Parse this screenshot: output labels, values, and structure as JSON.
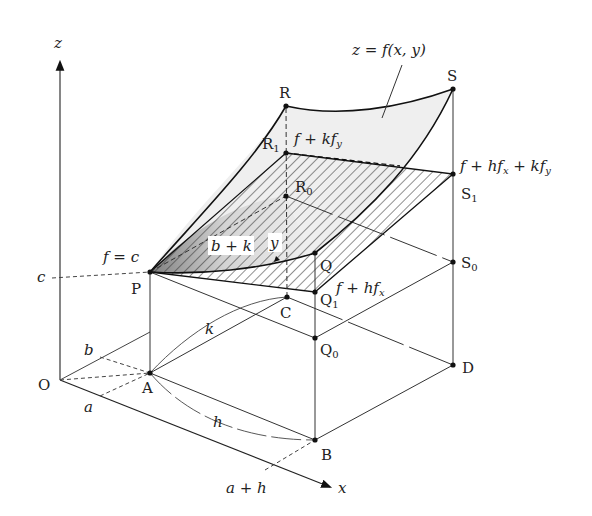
{
  "figure": {
    "type": "3D surface linear approximation diagram",
    "surface_label": "z = f(x, y)",
    "axes": {
      "x": "x",
      "z": "z",
      "origin": "O"
    },
    "axis_ticks": {
      "a": "a",
      "b": "b",
      "c": "c",
      "a_plus_h": "a + h"
    },
    "points": {
      "O": "O",
      "A": "A",
      "B": "B",
      "C": "C",
      "D": "D",
      "P": "P",
      "Q": "Q",
      "Q1": "Q",
      "Q0": "Q",
      "R": "R",
      "R1": "R",
      "R0": "R",
      "S": "S",
      "S1": "S",
      "S0": "S"
    },
    "subscripts": {
      "one": "1",
      "zero": "0"
    },
    "annotations": {
      "f_eq_c": "f = c",
      "f_plus_kfy": "f + kf",
      "f_plus_hfx_kfy": "f + hf",
      "f_plus_hfx": "f + hf",
      "b_plus_k": "b + k",
      "y": "y",
      "h": "h",
      "k": "k",
      "sub_x": "x",
      "sub_y": "y",
      "plus_k": " + kf"
    }
  }
}
